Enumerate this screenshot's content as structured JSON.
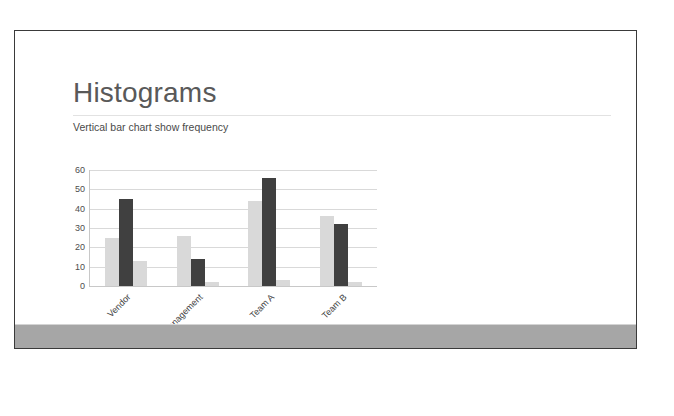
{
  "slide": {
    "title": "Histograms",
    "subtitle": "Vertical bar chart show frequency",
    "colors": {
      "title_text": "#595959",
      "subtitle_text": "#4a4a4a",
      "slide_border": "#3a3a3a",
      "footer_bar": "#a6a6a6",
      "bar_light": "#d9d9d9",
      "bar_dark": "#404040",
      "gridline": "#d9d9d9"
    }
  },
  "chart_data": {
    "type": "bar",
    "title": "",
    "xlabel": "",
    "ylabel": "",
    "ylim": [
      0,
      60
    ],
    "yticks": [
      0,
      10,
      20,
      30,
      40,
      50,
      60
    ],
    "grid": true,
    "legend": "none",
    "categories": [
      "Vendor",
      "Management",
      "Team A",
      "Team B"
    ],
    "series": [
      {
        "name": "Series 1",
        "color": "#d9d9d9",
        "values": [
          25,
          26,
          44,
          36
        ]
      },
      {
        "name": "Series 2",
        "color": "#404040",
        "values": [
          45,
          14,
          56,
          32
        ]
      },
      {
        "name": "Series 3",
        "color": "#d9d9d9",
        "values": [
          13,
          2,
          3,
          2
        ]
      }
    ]
  }
}
